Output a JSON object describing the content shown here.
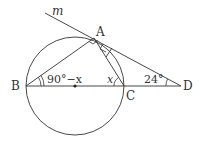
{
  "diagram": {
    "points": {
      "A": {
        "label": "A",
        "x": 94,
        "y": 38
      },
      "B": {
        "label": "B",
        "x": 26,
        "y": 86
      },
      "C": {
        "label": "C",
        "x": 124,
        "y": 86
      },
      "D": {
        "label": "D",
        "x": 181,
        "y": 86
      },
      "O": {
        "label": "",
        "x": 75,
        "y": 86
      }
    },
    "circle": {
      "cx": 75,
      "cy": 86,
      "r": 49
    },
    "line_label": "m",
    "angle_labels": {
      "B": "90°−x",
      "C": "x",
      "D": "24°"
    },
    "colors": {
      "stroke": "#333333",
      "background": "#ffffff"
    }
  }
}
